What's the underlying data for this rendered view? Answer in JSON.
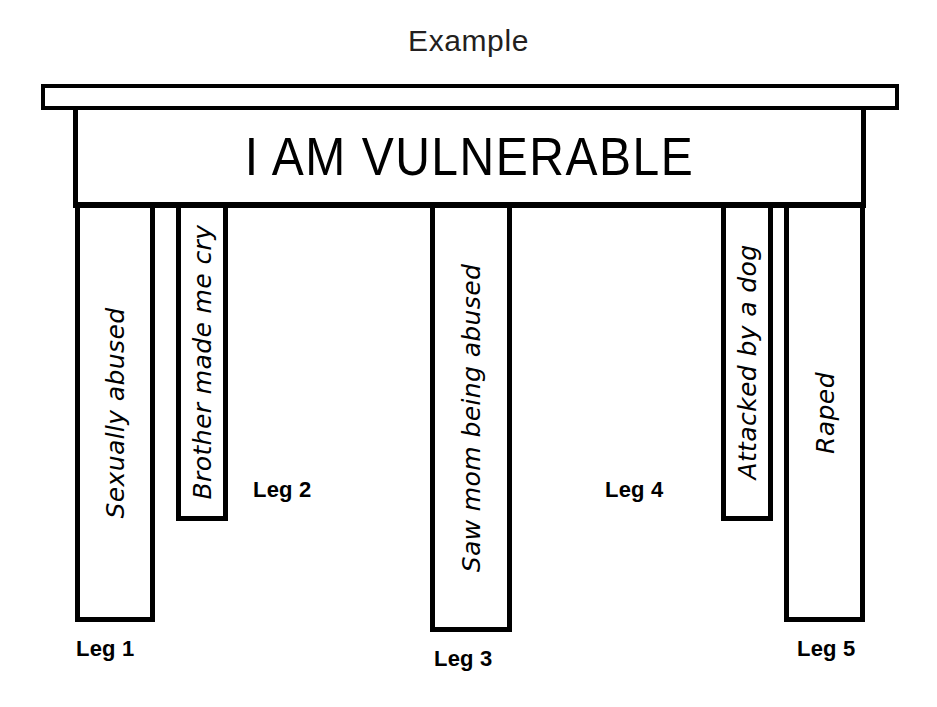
{
  "diagram": {
    "title": "Example",
    "tabletop": {
      "headline": "I AM VULNERABLE"
    },
    "legs": [
      {
        "caption": "Leg 1",
        "text": "Sexually abused",
        "shadow_side": "right",
        "has_shadow": true
      },
      {
        "caption": "Leg 2",
        "text": "Brother made me cry",
        "shadow_side": "right",
        "has_shadow": true
      },
      {
        "caption": "Leg 3",
        "text": "Saw mom being abused",
        "shadow_side": "none",
        "has_shadow": false
      },
      {
        "caption": "Leg 4",
        "text": "Attacked by a dog",
        "shadow_side": "left",
        "has_shadow": true
      },
      {
        "caption": "Leg 5",
        "text": "Raped",
        "shadow_side": "left",
        "has_shadow": true
      }
    ]
  },
  "colors": {
    "ink": "#000000",
    "title_ink": "#231f20",
    "shadow_face": "#3a3a3a",
    "background": "#ffffff"
  }
}
